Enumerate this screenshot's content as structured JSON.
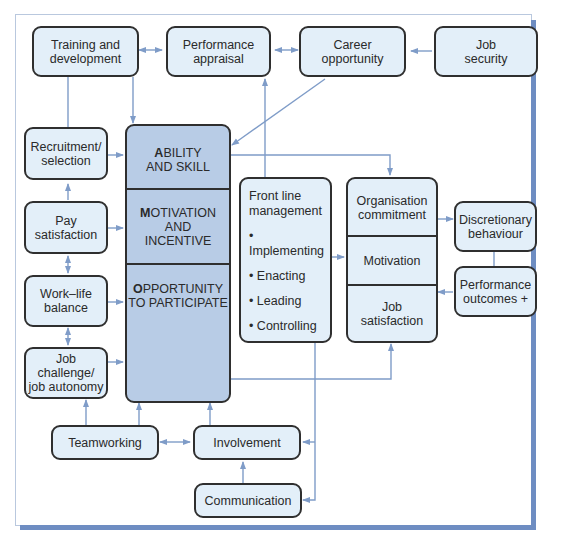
{
  "diagram": {
    "top_row": {
      "training": "Training and\ndevelopment",
      "appraisal": "Performance\nappraisal",
      "career": "Career\nopportunity",
      "security": "Job\nsecurity"
    },
    "left_column": {
      "recruitment": "Recruitment/\nselection",
      "pay": "Pay\nsatisfaction",
      "worklife": "Work–life\nbalance",
      "challenge": "Job challenge/\njob autonomy"
    },
    "amo": {
      "ability_initial": "A",
      "ability_rest": "BILITY\nAND SKILL",
      "motivation_initial": "M",
      "motivation_rest": "OTIVATION\nAND\nINCENTIVE",
      "opportunity_initial": "O",
      "opportunity_rest": "PPORTUNITY\nTO PARTICIPATE"
    },
    "front_line": {
      "title": "Front line\nmanagement",
      "items": [
        "• Implementing",
        "• Enacting",
        "• Leading",
        "• Controlling"
      ]
    },
    "outcomes": {
      "commitment": "Organisation\ncommitment",
      "motivation": "Motivation",
      "satisfaction": "Job\nsatisfaction"
    },
    "right_column": {
      "discretionary": "Discretionary\nbehaviour",
      "performance": "Performance\noutcomes +"
    },
    "bottom_row": {
      "teamworking": "Teamworking",
      "involvement": "Involvement",
      "communication": "Communication"
    },
    "colors": {
      "box_fill": "#e3eff9",
      "amo_fill": "#b8cce6",
      "arrow": "#7f9cc8",
      "border": "#2f2f2f",
      "frame_shadow": "#6e8dc2"
    }
  }
}
